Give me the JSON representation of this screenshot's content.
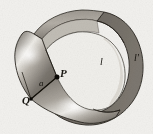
{
  "figure": {
    "background_color": "#f2f1ee",
    "ink_color": "#16140f",
    "band_dark_color": "#6f6a63",
    "band_mid_color": "#8d8881",
    "band_light_color": "#cfcac2",
    "highlight_color": "#f4f2ed",
    "outline_color": "#2b2822"
  },
  "labels": {
    "point_p": "P",
    "point_q": "Q",
    "arc_a": "a",
    "curve_l": "l",
    "curve_l_prime": "l'"
  },
  "geometry": {
    "point_p_coords": [
      57,
      77
    ],
    "point_q_coords": [
      31,
      99
    ],
    "segment_pq": "from Q to P",
    "band_type": "mobius-strip",
    "twist_location": "left"
  }
}
